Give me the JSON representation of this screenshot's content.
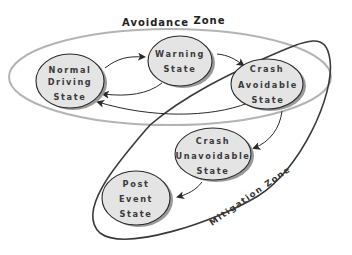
{
  "diagram": {
    "zones": {
      "avoidance": {
        "label_part1": "Avoidance",
        "label_part2": "Zone",
        "stroke": "#b4b4b4"
      },
      "mitigation": {
        "label": "Mitigation Zone",
        "stroke": "#3a3a3a"
      }
    },
    "nodes": [
      {
        "id": "normal",
        "lines": [
          "Normal",
          "Driving",
          "State"
        ]
      },
      {
        "id": "warning",
        "lines": [
          "Warning",
          "State"
        ]
      },
      {
        "id": "crash_avoidable",
        "lines": [
          "Crash",
          "Avoidable",
          "State"
        ]
      },
      {
        "id": "crash_unavoidable",
        "lines": [
          "Crash",
          "Unavoidable",
          "State"
        ]
      },
      {
        "id": "post_event",
        "lines": [
          "Post",
          "Event",
          "State"
        ]
      }
    ],
    "edges": [
      {
        "from": "normal",
        "to": "warning"
      },
      {
        "from": "warning",
        "to": "crash_avoidable"
      },
      {
        "from": "warning",
        "to": "normal"
      },
      {
        "from": "crash_avoidable",
        "to": "normal"
      },
      {
        "from": "crash_avoidable",
        "to": "crash_unavoidable"
      },
      {
        "from": "crash_unavoidable",
        "to": "post_event"
      }
    ],
    "colors": {
      "node_fill": "#e4e4e4",
      "node_stroke": "#2a2a2a",
      "node_shadow": "#9a9a9a",
      "edge": "#2a2a2a"
    }
  }
}
